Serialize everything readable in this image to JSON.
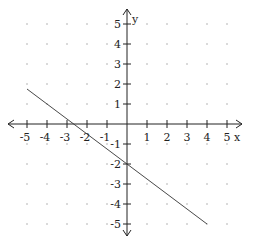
{
  "chart_data": {
    "type": "line",
    "title": "",
    "xlabel": "x",
    "ylabel": "y",
    "xlim": [
      -5,
      5
    ],
    "ylim": [
      -5,
      5
    ],
    "grid": "dots at integer points",
    "x_ticks": [
      -5,
      -4,
      -3,
      -2,
      -1,
      1,
      2,
      3,
      4,
      5
    ],
    "y_ticks": [
      5,
      4,
      3,
      2,
      1,
      -1,
      -2,
      -3,
      -4,
      -5
    ],
    "series": [
      {
        "name": "line",
        "equation": "y = -3/4 x - 2",
        "x": [
          -5,
          4
        ],
        "y": [
          1.75,
          -5
        ]
      }
    ],
    "colors": {
      "axis": "#222222",
      "line": "#333333",
      "dots": "#999999"
    }
  }
}
